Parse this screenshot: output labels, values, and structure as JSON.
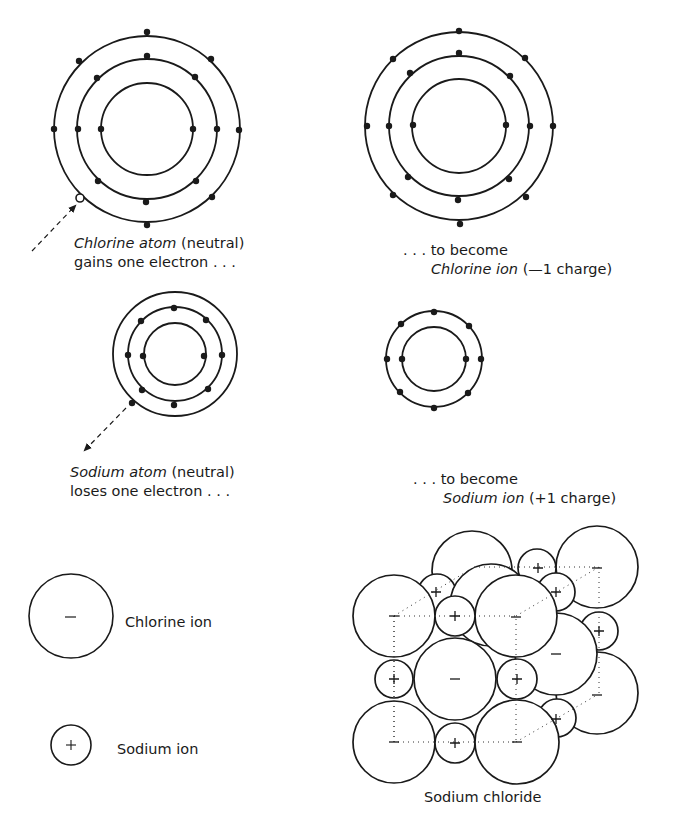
{
  "figure": {
    "chlorine_atom": {
      "name": "Chlorine atom",
      "qualifier": "(neutral)",
      "action": "gains one electron . . .",
      "shells_electrons": [
        2,
        8,
        7
      ],
      "gained_electron_marker": "open-circle"
    },
    "chlorine_ion": {
      "prefix": ". . . to become",
      "name": "Chlorine ion",
      "charge_text": "(—1 charge)",
      "shells_electrons": [
        2,
        8,
        8
      ]
    },
    "sodium_atom": {
      "name": "Sodium atom",
      "qualifier": "(neutral)",
      "action": "loses one electron . . .",
      "shells_electrons": [
        2,
        8,
        1
      ]
    },
    "sodium_ion": {
      "prefix": ". . . to become",
      "name": "Sodium ion",
      "charge_text": "(+1 charge)",
      "shells_electrons": [
        2,
        8
      ]
    },
    "legend": {
      "chlorine": {
        "symbol": "–",
        "label": "Chlorine ion"
      },
      "sodium": {
        "symbol": "+",
        "label": "Sodium ion"
      }
    },
    "lattice": {
      "caption": "Sodium chloride",
      "plus": "+",
      "minus": "–"
    }
  }
}
